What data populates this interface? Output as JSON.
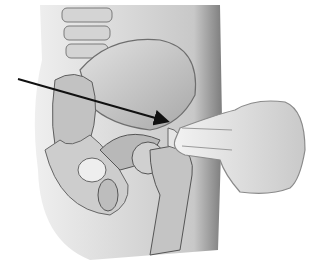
{
  "figure": {
    "caption": "",
    "colors": {
      "background": "#ffffff",
      "skin_shade": "#8a8a8a",
      "bone_light": "#d9d9d9",
      "bone_mid": "#b3b3b3",
      "bone_dark": "#6e6e6e",
      "arrow": "#111111"
    },
    "arrow": {
      "x1": 18,
      "y1": 79,
      "x2": 168,
      "y2": 122
    }
  }
}
